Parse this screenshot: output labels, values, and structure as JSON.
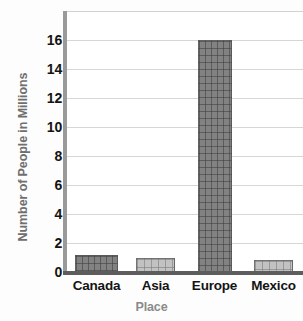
{
  "chart_data": {
    "type": "bar",
    "title": "",
    "categories": [
      "Canada",
      "Asia",
      "Europe",
      "Mexico"
    ],
    "values": [
      1.2,
      1.0,
      16,
      0.8
    ],
    "series": [
      {
        "name": "Number of People in Millions",
        "values": [
          1.2,
          1.0,
          16,
          0.8
        ]
      }
    ],
    "xlabel": "Place",
    "ylabel": "Number of People in Millions",
    "ylim": [
      0,
      18
    ],
    "yticks": [
      "0",
      "2",
      "4",
      "6",
      "8",
      "10",
      "12",
      "14",
      "16"
    ],
    "ytick_values": [
      0,
      2,
      4,
      6,
      8,
      10,
      12,
      14,
      16
    ],
    "grid": true,
    "legend": false,
    "bar_colors": [
      "#828282",
      "#c2c2c2",
      "#828282",
      "#c2c2c2"
    ],
    "bar_style": "building-texture",
    "colors": {
      "dark_bar": "#828282",
      "light_bar": "#c2c2c2",
      "gridline": "#d6d6d6",
      "axis_line": "#9a9a9a",
      "baseline": "#5d5d5d",
      "tick_text": "#141414",
      "axis_title_text": "#8a8a8a",
      "plot_background": "#ffffff"
    }
  }
}
